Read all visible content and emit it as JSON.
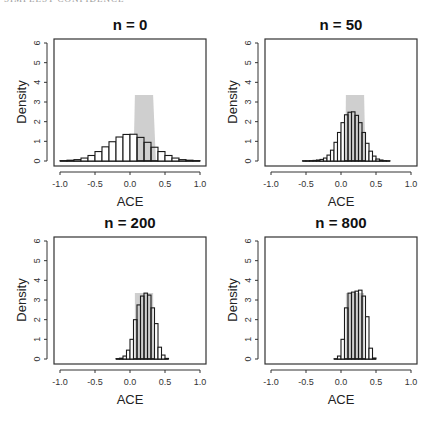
{
  "page_header": {
    "left": "SIMPLEST CONFIDENCE",
    "right": ""
  },
  "colors": {
    "bar_fill": "#ffffff",
    "bar_stroke": "#1a1a1a",
    "band_fill": "#cfcfcf",
    "axis": "#333333"
  },
  "chart_data": [
    {
      "type": "bar",
      "title": "n = 0",
      "xlabel": "ACE",
      "ylabel": "Density",
      "xlim": [
        -1.0,
        1.0
      ],
      "ylim": [
        0,
        6
      ],
      "xticks": [
        "-1.0",
        "-0.5",
        "0.0",
        "0.5",
        "1.0"
      ],
      "yticks": [
        "0",
        "1",
        "2",
        "3",
        "4",
        "5",
        "6"
      ],
      "band": {
        "x_top": [
          0.07,
          0.33
        ],
        "x_bottom": [
          0.05,
          0.37
        ],
        "height": 3.35
      },
      "bin_width": 0.1,
      "bins": [
        -1.0,
        -0.9,
        -0.8,
        -0.7,
        -0.6,
        -0.5,
        -0.4,
        -0.3,
        -0.2,
        -0.1,
        0.0,
        0.1,
        0.2,
        0.3,
        0.4,
        0.5,
        0.6,
        0.7,
        0.8,
        0.9
      ],
      "values": [
        0.02,
        0.04,
        0.07,
        0.15,
        0.28,
        0.48,
        0.72,
        0.98,
        1.22,
        1.35,
        1.36,
        1.2,
        0.95,
        0.7,
        0.48,
        0.28,
        0.15,
        0.07,
        0.04,
        0.02
      ]
    },
    {
      "type": "bar",
      "title": "n = 50",
      "xlabel": "ACE",
      "ylabel": "Density",
      "xlim": [
        -1.0,
        1.0
      ],
      "ylim": [
        0,
        6
      ],
      "xticks": [
        "-1.0",
        "-0.5",
        "0.0",
        "0.5",
        "1.0"
      ],
      "yticks": [
        "0",
        "1",
        "2",
        "3",
        "4",
        "5",
        "6"
      ],
      "band": {
        "x_top": [
          0.07,
          0.33
        ],
        "x_bottom": [
          0.06,
          0.35
        ],
        "height": 3.35
      },
      "bin_width": 0.05,
      "bins": [
        -0.55,
        -0.5,
        -0.45,
        -0.4,
        -0.35,
        -0.3,
        -0.25,
        -0.2,
        -0.15,
        -0.1,
        -0.05,
        0.0,
        0.05,
        0.1,
        0.15,
        0.2,
        0.25,
        0.3,
        0.35,
        0.4,
        0.45,
        0.5,
        0.55,
        0.6,
        0.65
      ],
      "values": [
        0.01,
        0.01,
        0.02,
        0.03,
        0.05,
        0.08,
        0.15,
        0.3,
        0.55,
        0.95,
        1.45,
        1.95,
        2.35,
        2.48,
        2.5,
        2.32,
        1.95,
        1.45,
        0.9,
        0.5,
        0.25,
        0.1,
        0.05,
        0.02,
        0.01
      ]
    },
    {
      "type": "bar",
      "title": "n = 200",
      "xlabel": "ACE",
      "ylabel": "Density",
      "xlim": [
        -1.0,
        1.0
      ],
      "ylim": [
        0,
        6
      ],
      "xticks": [
        "-1.0",
        "-0.5",
        "0.0",
        "0.5",
        "1.0"
      ],
      "yticks": [
        "0",
        "1",
        "2",
        "3",
        "4",
        "5",
        "6"
      ],
      "band": {
        "x_top": [
          0.07,
          0.33
        ],
        "x_bottom": [
          0.07,
          0.34
        ],
        "height": 3.35
      },
      "bin_width": 0.05,
      "bins": [
        -0.2,
        -0.15,
        -0.1,
        -0.05,
        0.0,
        0.05,
        0.1,
        0.15,
        0.2,
        0.25,
        0.3,
        0.35,
        0.4,
        0.45,
        0.5
      ],
      "values": [
        0.02,
        0.04,
        0.15,
        0.45,
        1.0,
        2.0,
        2.75,
        3.2,
        3.35,
        3.25,
        2.6,
        1.8,
        0.6,
        0.2,
        0.03
      ]
    },
    {
      "type": "bar",
      "title": "n = 800",
      "xlabel": "ACE",
      "ylabel": "Density",
      "xlim": [
        -1.0,
        1.0
      ],
      "ylim": [
        0,
        6
      ],
      "xticks": [
        "-1.0",
        "-0.5",
        "0.0",
        "0.5",
        "1.0"
      ],
      "yticks": [
        "0",
        "1",
        "2",
        "3",
        "4",
        "5",
        "6"
      ],
      "band": {
        "x_top": [
          0.07,
          0.33
        ],
        "x_bottom": [
          0.07,
          0.33
        ],
        "height": 3.35
      },
      "bin_width": 0.05,
      "bins": [
        -0.1,
        -0.05,
        0.0,
        0.05,
        0.1,
        0.15,
        0.2,
        0.25,
        0.3,
        0.35,
        0.4,
        0.45
      ],
      "values": [
        0.01,
        0.15,
        1.0,
        2.6,
        3.35,
        3.4,
        3.45,
        3.5,
        3.2,
        2.15,
        0.55,
        0.05
      ]
    }
  ]
}
